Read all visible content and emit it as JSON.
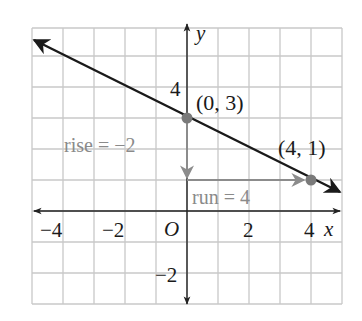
{
  "figure": {
    "grid": {
      "xmin": -5,
      "xmax": 5,
      "ymin": -3,
      "ymax": 6,
      "step": 1
    },
    "axes": {
      "x_label": "x",
      "y_label": "y",
      "origin_label": "O",
      "x_ticks": [
        {
          "value": -4,
          "label": "−4"
        },
        {
          "value": -2,
          "label": "−2"
        },
        {
          "value": 2,
          "label": "2"
        },
        {
          "value": 4,
          "label": "4"
        }
      ],
      "y_ticks": [
        {
          "value": 4,
          "label": "4"
        },
        {
          "value": -2,
          "label": "−2"
        }
      ]
    },
    "points": [
      {
        "x": 0,
        "y": 3,
        "label": "(0, 3)"
      },
      {
        "x": 4,
        "y": 1,
        "label": "(4, 1)"
      }
    ],
    "annotations": {
      "rise": "rise = −2",
      "run": "run = 4"
    },
    "colors": {
      "grid": "#c8c8c8",
      "line": "#1a1a1a",
      "axis": "#222222",
      "point": "#7a7a7a",
      "annotation": "#8a8a8a",
      "annotation_arrow": "#8c8c8c"
    }
  },
  "chart_data": {
    "type": "line",
    "title": "",
    "xlabel": "x",
    "ylabel": "y",
    "xlim": [
      -5,
      5
    ],
    "ylim": [
      -3,
      6
    ],
    "grid": true,
    "series": [
      {
        "name": "line",
        "equation": "y = -1/2 x + 3",
        "x": [
          -5,
          0,
          4,
          5
        ],
        "values": [
          5.5,
          3,
          1,
          0.5
        ]
      }
    ],
    "points": [
      {
        "x": 0,
        "y": 3,
        "label": "(0, 3)"
      },
      {
        "x": 4,
        "y": 1,
        "label": "(4, 1)"
      }
    ],
    "annotations": [
      "rise = −2",
      "run = 4"
    ],
    "x_tick_labels": [
      "−4",
      "−2",
      "O",
      "2",
      "4"
    ],
    "y_tick_labels": [
      "4",
      "−2"
    ]
  }
}
